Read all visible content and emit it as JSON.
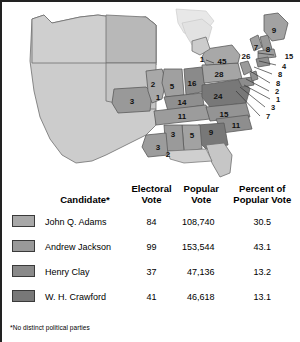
{
  "map": {
    "title": "Election of 1824 electoral vote map",
    "colors": {
      "adams": "#a8a8a8",
      "jackson": "#999999",
      "clay": "#8a8a8a",
      "crawford": "#787878",
      "territory": "#cccccc",
      "lake": "#e2e2e2",
      "outline": "#4a4a4a"
    },
    "state_labels": [
      {
        "value": "9",
        "x": 268,
        "y": 26
      },
      {
        "value": "7",
        "x": 250,
        "y": 43
      },
      {
        "value": "8",
        "x": 262,
        "y": 45
      },
      {
        "value": "26",
        "x": 240,
        "y": 52
      },
      {
        "value": "45",
        "x": 216,
        "y": 57
      },
      {
        "value": "1",
        "x": 196,
        "y": 55
      },
      {
        "value": "28",
        "x": 213,
        "y": 70
      },
      {
        "value": "16",
        "x": 186,
        "y": 79
      },
      {
        "value": "5",
        "x": 166,
        "y": 82
      },
      {
        "value": "2",
        "x": 147,
        "y": 80
      },
      {
        "value": "1",
        "x": 152,
        "y": 93
      },
      {
        "value": "3",
        "x": 126,
        "y": 97
      },
      {
        "value": "14",
        "x": 176,
        "y": 98
      },
      {
        "value": "24",
        "x": 212,
        "y": 92
      },
      {
        "value": "11",
        "x": 176,
        "y": 112
      },
      {
        "value": "15",
        "x": 218,
        "y": 110
      },
      {
        "value": "11",
        "x": 230,
        "y": 121
      },
      {
        "value": "3",
        "x": 167,
        "y": 130
      },
      {
        "value": "5",
        "x": 186,
        "y": 131
      },
      {
        "value": "9",
        "x": 205,
        "y": 128
      },
      {
        "value": "3",
        "x": 152,
        "y": 143
      },
      {
        "value": "2",
        "x": 162,
        "y": 150
      }
    ],
    "leader_labels": [
      {
        "value": "15",
        "x": 283,
        "y": 52
      },
      {
        "value": "4",
        "x": 278,
        "y": 62
      },
      {
        "value": "8",
        "x": 274,
        "y": 70
      },
      {
        "value": "8",
        "x": 272,
        "y": 79
      },
      {
        "value": "2",
        "x": 271,
        "y": 87
      },
      {
        "value": "1",
        "x": 272,
        "y": 95
      },
      {
        "value": "3",
        "x": 267,
        "y": 103
      },
      {
        "value": "7",
        "x": 262,
        "y": 112
      }
    ]
  },
  "table": {
    "headers": {
      "candidate": "Candidate*",
      "electoral_vote": "Electoral\nVote",
      "electoral_vote_l1": "Electoral",
      "electoral_vote_l2": "Vote",
      "popular_vote_l1": "Popular",
      "popular_vote_l2": "Vote",
      "percent_l1": "Percent of",
      "percent_l2": "Popular Vote"
    },
    "rows": [
      {
        "name": "John Q. Adams",
        "electoral_vote": "84",
        "popular_vote": "108,740",
        "percent": "30.5",
        "color": "#a8a8a8"
      },
      {
        "name": "Andrew Jackson",
        "electoral_vote": "99",
        "popular_vote": "153,544",
        "percent": "43.1",
        "color": "#999999"
      },
      {
        "name": "Henry Clay",
        "electoral_vote": "37",
        "popular_vote": "47,136",
        "percent": "13.2",
        "color": "#8a8a8a"
      },
      {
        "name": "W. H. Crawford",
        "electoral_vote": "41",
        "popular_vote": "46,618",
        "percent": "13.1",
        "color": "#787878"
      }
    ]
  },
  "footnote": {
    "marker": "*",
    "text": "No distinct political parties"
  },
  "chart_data": {
    "type": "table",
    "categories": [
      "John Q. Adams",
      "Andrew Jackson",
      "Henry Clay",
      "W. H. Crawford"
    ],
    "series": [
      {
        "name": "Electoral Vote",
        "values": [
          84,
          99,
          37,
          41
        ]
      },
      {
        "name": "Popular Vote",
        "values": [
          108740,
          153544,
          47136,
          46618
        ]
      },
      {
        "name": "Percent of Popular Vote",
        "values": [
          30.5,
          43.1,
          13.2,
          13.1
        ]
      }
    ],
    "state_electoral_votes": [
      9,
      7,
      8,
      26,
      45,
      1,
      28,
      16,
      5,
      2,
      1,
      3,
      14,
      24,
      11,
      15,
      11,
      3,
      5,
      9,
      3,
      2,
      15,
      4,
      8,
      8,
      2,
      1,
      3,
      7
    ],
    "xlabel": "",
    "ylabel": "",
    "legend_position": "left"
  }
}
